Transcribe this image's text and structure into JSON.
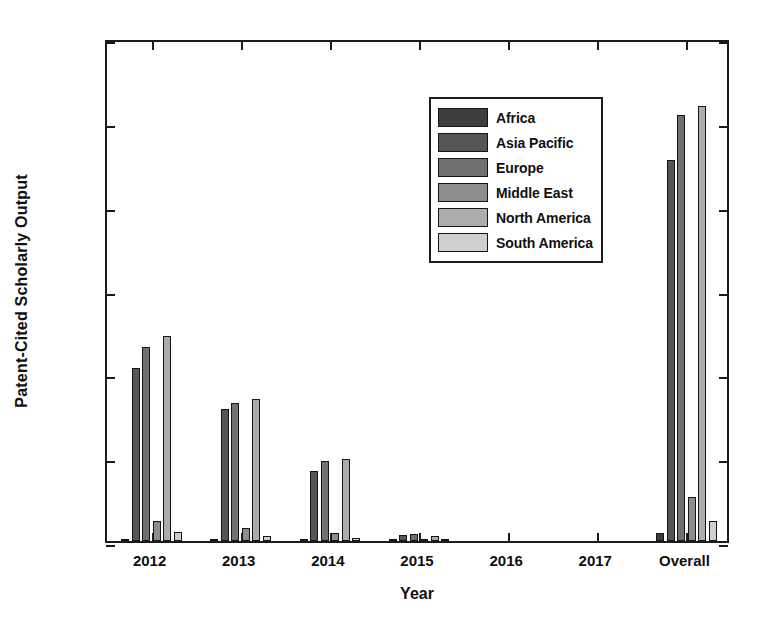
{
  "figure": {
    "bleed_text_above": "",
    "background": "#ffffff",
    "axis_color": "#1b1b1b"
  },
  "chart_data": {
    "type": "bar",
    "title": "",
    "subtitle": "",
    "xlabel": "Year",
    "ylabel": "Patent-Cited Scholarly Output",
    "categories": [
      "2012",
      "2013",
      "2014",
      "2015",
      "2016",
      "2017",
      "Overall"
    ],
    "ylim": [
      0,
      3000
    ],
    "yticks": [
      0,
      500,
      1000,
      1500,
      2000,
      2500,
      3000
    ],
    "ytick_labels": [
      "0",
      "500",
      "1000",
      "1500",
      "2000",
      "2500",
      "3000"
    ],
    "grid": false,
    "legend_position": "upper center",
    "series": [
      {
        "name": "Africa",
        "color": "#3d3d3d",
        "values": [
          14,
          10,
          8,
          4,
          0,
          0,
          50
        ]
      },
      {
        "name": "Asia Pacific",
        "color": "#565656",
        "values": [
          1030,
          790,
          415,
          35,
          0,
          0,
          2270
        ]
      },
      {
        "name": "Europe",
        "color": "#707070",
        "values": [
          1160,
          825,
          480,
          40,
          0,
          0,
          2540
        ]
      },
      {
        "name": "Middle East",
        "color": "#8d8d8d",
        "values": [
          120,
          75,
          50,
          8,
          0,
          0,
          265
        ]
      },
      {
        "name": "North America",
        "color": "#acacac",
        "values": [
          1220,
          845,
          490,
          30,
          0,
          0,
          2595
        ]
      },
      {
        "name": "South America",
        "color": "#cfcfcf",
        "values": [
          55,
          30,
          18,
          4,
          0,
          0,
          120
        ]
      }
    ]
  }
}
